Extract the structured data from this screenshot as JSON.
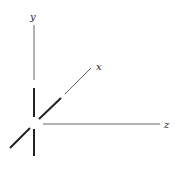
{
  "diagram": {
    "title": "",
    "type": "3d-coordinate-axes",
    "axes": [
      {
        "name": "y",
        "label": "y",
        "direction": "up"
      },
      {
        "name": "x",
        "label": "x",
        "direction": "diagonal-up-right"
      },
      {
        "name": "z",
        "label": "z",
        "direction": "right"
      }
    ],
    "colors": {
      "line": "#222222",
      "thin_line": "#555555",
      "background": "#ffffff"
    }
  }
}
